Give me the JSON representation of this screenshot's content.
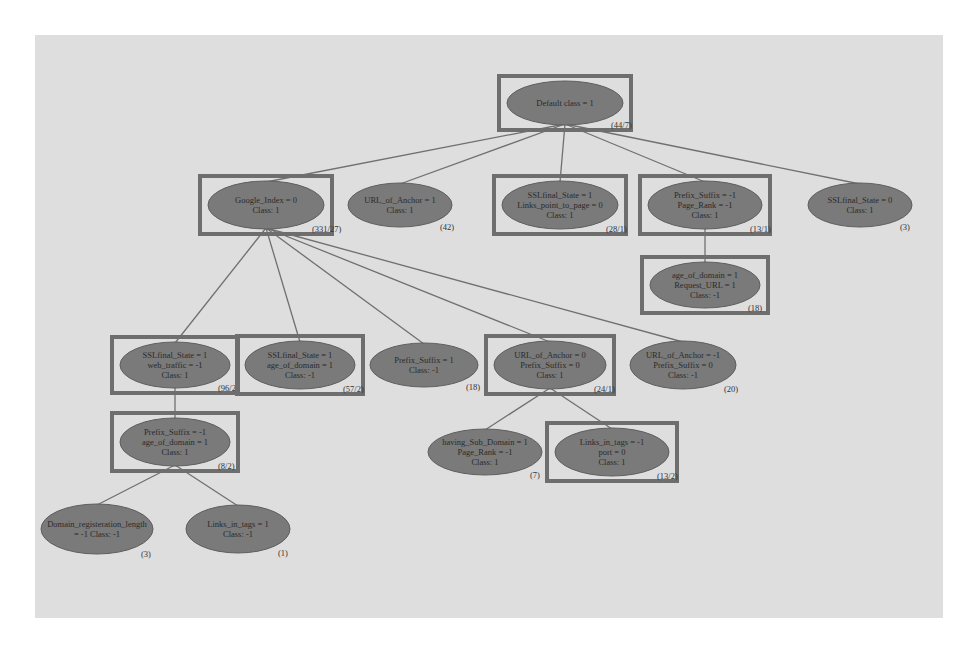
{
  "diagram": {
    "type": "decision-tree",
    "colors": {
      "background": "#dedede",
      "node_fill": "#7a7a7a",
      "node_stroke": "#5e5e5e",
      "highlight_box": "#6e6e6e",
      "edge": "#707070",
      "text": "#2a2a2a"
    },
    "nodes": [
      {
        "id": "root",
        "lines": [
          "Default class = 1"
        ],
        "count": "(44/7)",
        "boxed": true,
        "cx": 565,
        "cy": 103,
        "rx": 58,
        "ry": 22
      },
      {
        "id": "google-index",
        "lines": [
          "Google_Index = 0",
          "Class: 1"
        ],
        "count": "(331/27)",
        "boxed": true,
        "cx": 266,
        "cy": 205,
        "rx": 58,
        "ry": 24
      },
      {
        "id": "url-of-anchor-1",
        "lines": [
          "URL_of_Anchor = 1",
          "Class: 1"
        ],
        "count": "(42)",
        "boxed": false,
        "cx": 400,
        "cy": 205,
        "rx": 52,
        "ry": 22
      },
      {
        "id": "ssl-final-state-links",
        "lines": [
          "SSLfinal_State = 1",
          "Links_point_to_page = 0",
          "Class: 1"
        ],
        "count": "(28/1)",
        "boxed": true,
        "cx": 560,
        "cy": 205,
        "rx": 58,
        "ry": 24
      },
      {
        "id": "prefix-suffix-page-rank",
        "lines": [
          "Prefix_Suffix = -1",
          "Page_Rank = -1",
          "Class: 1"
        ],
        "count": "(13/1)",
        "boxed": true,
        "cx": 705,
        "cy": 205,
        "rx": 57,
        "ry": 24
      },
      {
        "id": "ssl-final-state-0",
        "lines": [
          "SSLfinal_State = 0",
          "Class: 1"
        ],
        "count": "(3)",
        "boxed": false,
        "cx": 860,
        "cy": 205,
        "rx": 52,
        "ry": 22
      },
      {
        "id": "age-of-domain-request-url",
        "lines": [
          "age_of_domain = 1",
          "Request_URL = 1",
          "Class: -1"
        ],
        "count": "(18)",
        "boxed": true,
        "cx": 705,
        "cy": 285,
        "rx": 55,
        "ry": 23
      },
      {
        "id": "ssl-sub-suffix",
        "lines": [
          "SSLfinal_State = 1",
          "web_traffic = -1",
          "Class: 1"
        ],
        "count": "(96/2)",
        "boxed": true,
        "cx": 175,
        "cy": 365,
        "rx": 55,
        "ry": 23
      },
      {
        "id": "ssl-age-domain",
        "lines": [
          "SSLfinal_State = 1",
          "age_of_domain = 1",
          "Class: -1"
        ],
        "count": "(57/2)",
        "boxed": true,
        "cx": 300,
        "cy": 365,
        "rx": 55,
        "ry": 24
      },
      {
        "id": "prefix-suffix-1",
        "lines": [
          "Prefix_Suffix = 1",
          "Class: -1"
        ],
        "count": "(18)",
        "boxed": false,
        "cx": 424,
        "cy": 365,
        "rx": 54,
        "ry": 22
      },
      {
        "id": "url-anchor-prefix-0",
        "lines": [
          "URL_of_Anchor = 0",
          "Prefix_Suffix = 0",
          "Class: 1"
        ],
        "count": "(24/1)",
        "boxed": true,
        "cx": 550,
        "cy": 365,
        "rx": 56,
        "ry": 24
      },
      {
        "id": "url-anchor-prefix-neg",
        "lines": [
          "URL_of_Anchor = -1",
          "Prefix_Suffix = 0",
          "Class: -1"
        ],
        "count": "(20)",
        "boxed": false,
        "cx": 683,
        "cy": 365,
        "rx": 53,
        "ry": 24
      },
      {
        "id": "having-sub-domain",
        "lines": [
          "having_Sub_Domain = 1",
          "Page_Rank = -1",
          "Class: 1"
        ],
        "count": "(7)",
        "boxed": false,
        "cx": 485,
        "cy": 452,
        "rx": 57,
        "ry": 23
      },
      {
        "id": "links-in-tags-port",
        "lines": [
          "Links_in_tags = -1",
          "port = 0",
          "Class: 1"
        ],
        "count": "(13/2)",
        "boxed": true,
        "cx": 612,
        "cy": 452,
        "rx": 57,
        "ry": 24
      },
      {
        "id": "prefix-age-domain",
        "lines": [
          "Prefix_Suffix = -1",
          "age_of_domain = 1",
          "Class: 1"
        ],
        "count": "(8/2)",
        "boxed": true,
        "cx": 175,
        "cy": 442,
        "rx": 55,
        "ry": 24
      },
      {
        "id": "domain-registration",
        "lines": [
          "Domain_registeration_length",
          "= -1         Class: -1"
        ],
        "count": "(3)",
        "boxed": false,
        "cx": 97,
        "cy": 529,
        "rx": 56,
        "ry": 25
      },
      {
        "id": "links-in-tags-2",
        "lines": [
          "Links_in_tags = 1",
          "Class: -1"
        ],
        "count": "(1)",
        "boxed": false,
        "cx": 238,
        "cy": 529,
        "rx": 52,
        "ry": 24
      }
    ],
    "edges": [
      {
        "from": "root",
        "to": "google-index"
      },
      {
        "from": "root",
        "to": "url-of-anchor-1"
      },
      {
        "from": "root",
        "to": "ssl-final-state-links"
      },
      {
        "from": "root",
        "to": "prefix-suffix-page-rank"
      },
      {
        "from": "root",
        "to": "ssl-final-state-0"
      },
      {
        "from": "prefix-suffix-page-rank",
        "to": "age-of-domain-request-url"
      },
      {
        "from": "google-index",
        "to": "ssl-sub-suffix"
      },
      {
        "from": "google-index",
        "to": "ssl-age-domain"
      },
      {
        "from": "google-index",
        "to": "prefix-suffix-1"
      },
      {
        "from": "google-index",
        "to": "url-anchor-prefix-0"
      },
      {
        "from": "google-index",
        "to": "url-anchor-prefix-neg"
      },
      {
        "from": "ssl-sub-suffix",
        "to": "prefix-age-domain"
      },
      {
        "from": "url-anchor-prefix-0",
        "to": "having-sub-domain"
      },
      {
        "from": "url-anchor-prefix-0",
        "to": "links-in-tags-port"
      },
      {
        "from": "prefix-age-domain",
        "to": "domain-registration"
      },
      {
        "from": "prefix-age-domain",
        "to": "links-in-tags-2"
      }
    ]
  }
}
